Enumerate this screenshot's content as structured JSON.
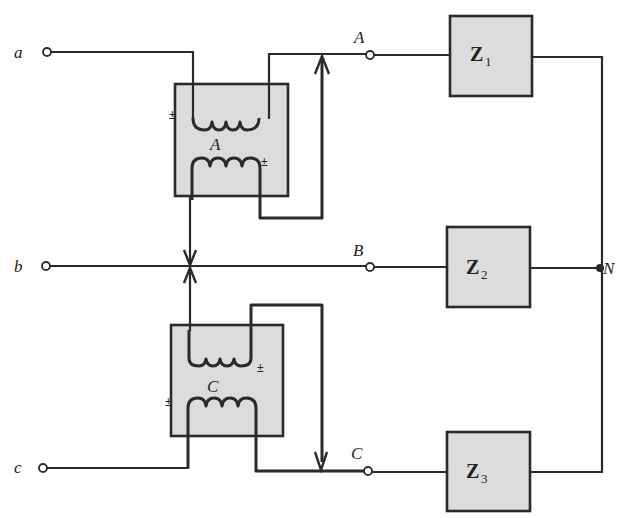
{
  "diagram": {
    "type": "three-phase autotransformer/booster circuit with wye load",
    "input_terminals": [
      {
        "label": "a"
      },
      {
        "label": "b"
      },
      {
        "label": "c"
      }
    ],
    "output_terminals": [
      {
        "label": "A"
      },
      {
        "label": "B"
      },
      {
        "label": "C"
      }
    ],
    "transformers": [
      {
        "label": "A",
        "polarity_marks": [
          "±",
          "±"
        ]
      },
      {
        "label": "C",
        "polarity_marks": [
          "±",
          "±"
        ]
      }
    ],
    "impedances": [
      {
        "symbol": "Z",
        "subscript": "1"
      },
      {
        "symbol": "Z",
        "subscript": "2"
      },
      {
        "symbol": "Z",
        "subscript": "3"
      }
    ],
    "neutral_node": {
      "label": "N"
    },
    "colors": {
      "line": "#2a2a2a",
      "box_fill": "#dcdcdc",
      "background": "#ffffff"
    }
  }
}
